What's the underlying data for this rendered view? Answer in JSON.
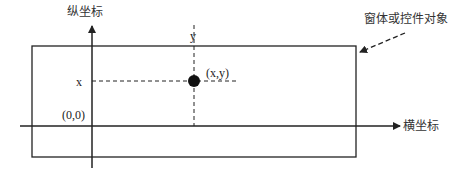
{
  "diagram": {
    "labels": {
      "y_axis": "纵坐标",
      "x_axis": "横坐标",
      "object": "窗体或控件对象",
      "y_tick": "y",
      "x_tick": "x",
      "point": "(x,y)",
      "origin": "(0,0)"
    },
    "geometry": {
      "rect": {
        "x": 32,
        "y": 46,
        "w": 324,
        "h": 111
      },
      "y_axis": {
        "x": 92,
        "y1": 24,
        "y2": 168
      },
      "x_axis": {
        "y": 126,
        "x1": 20,
        "x2": 400
      },
      "point": {
        "cx": 194,
        "cy": 81,
        "r": 6
      },
      "dash_v": {
        "x": 194,
        "y1": 25,
        "y2": 126
      },
      "dash_h": {
        "y": 81,
        "x1": 92,
        "x2": 238
      },
      "object_arrow": {
        "x1": 405,
        "y1": 33,
        "x2": 358,
        "y2": 53
      }
    },
    "colors": {
      "stroke": "#222222",
      "text": "#333333",
      "background": "#ffffff"
    }
  }
}
